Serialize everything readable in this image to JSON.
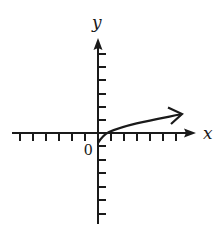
{
  "figure": {
    "type": "coordinate-plane-graph",
    "x_axis_label": "x",
    "y_axis_label": "y",
    "origin_label": "0",
    "colors": {
      "stroke": "#1a1a1a",
      "background": "#ffffff"
    }
  },
  "axes": {
    "x_ticks_negative": 6,
    "x_ticks_positive": 6,
    "y_ticks_positive": 6,
    "y_ticks_negative": 6,
    "x_range": [
      -7,
      7
    ],
    "y_range": [
      -7,
      7
    ]
  },
  "curve": {
    "description": "increasing concave-down curve starting just below origin, crossing x-axis near x=0.75, ending with an arrow to the upper right",
    "start_point": [
      0,
      -0.75
    ],
    "x_intercept": 0.75,
    "end_arrow_point": [
      6.4,
      1.4
    ],
    "has_arrow_end": true,
    "has_open_start": false
  }
}
